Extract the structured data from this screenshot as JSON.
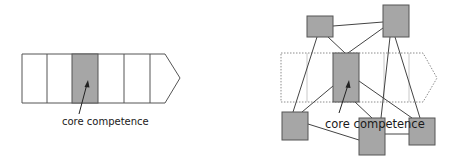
{
  "diagrams": {
    "left": {
      "title": "Linear value chain",
      "label": "core competence",
      "cells": 6,
      "highlighted_cell_index": 2
    },
    "right": {
      "title": "Network of competences",
      "label": "core competence",
      "nodes": 6
    }
  },
  "colors": {
    "outline": "#4a4a4a",
    "fill_highlight": "#a6a6a6",
    "dashed_outline": "#8c8c8c",
    "background": "#ffffff"
  }
}
